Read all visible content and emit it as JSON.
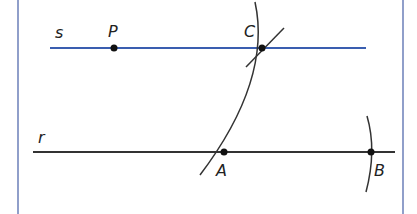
{
  "diagram": {
    "frame_color": "#6b7fb8",
    "line_s": {
      "label": "s",
      "color": "#3a5eb0"
    },
    "line_r": {
      "label": "r",
      "color": "#333333"
    },
    "points": {
      "P": {
        "label": "P"
      },
      "C": {
        "label": "C"
      },
      "A": {
        "label": "A"
      },
      "B": {
        "label": "B"
      }
    }
  }
}
